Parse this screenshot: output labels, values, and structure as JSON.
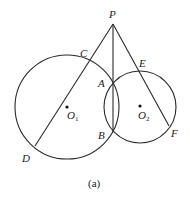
{
  "diagram": {
    "caption": "(a)",
    "points": {
      "P": {
        "label": "P",
        "x": 113,
        "y": 24
      },
      "A": {
        "label": "A",
        "x": 113,
        "y": 83
      },
      "B": {
        "label": "B",
        "x": 113,
        "y": 132
      },
      "C": {
        "label": "C",
        "x": 89,
        "y": 62
      },
      "D": {
        "label": "D",
        "x": 35,
        "y": 146
      },
      "E": {
        "label": "E",
        "x": 140,
        "y": 72
      },
      "F": {
        "label": "F",
        "x": 169,
        "y": 126
      }
    },
    "circles": [
      {
        "name": "O1",
        "label": "O",
        "subscript": "1",
        "cx": 67,
        "cy": 107,
        "r": 52
      },
      {
        "name": "O2",
        "label": "O",
        "subscript": "2",
        "cx": 140,
        "cy": 107,
        "r": 36
      }
    ],
    "segments": [
      [
        "P",
        "D"
      ],
      [
        "P",
        "B"
      ],
      [
        "P",
        "F"
      ]
    ]
  }
}
